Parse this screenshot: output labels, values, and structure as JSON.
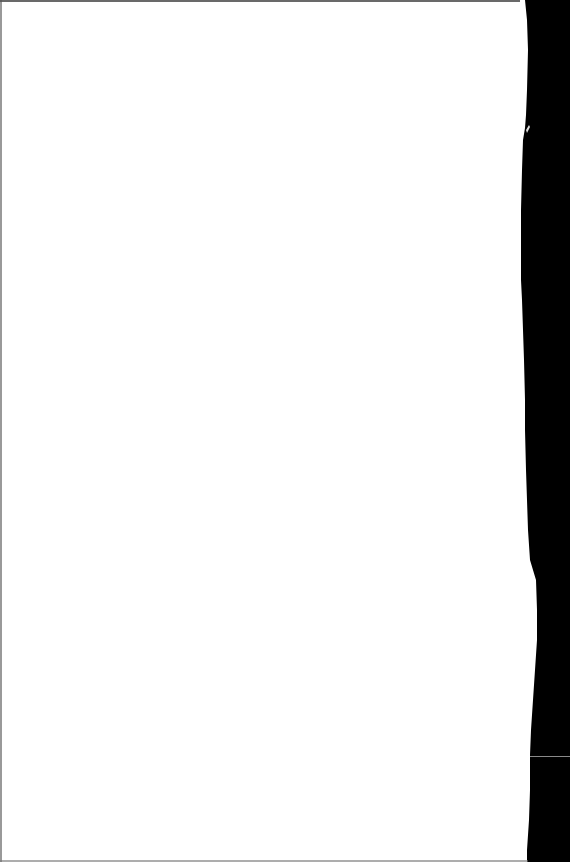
{
  "document": {
    "description": "Blank scanned page",
    "text": "",
    "colors": {
      "page": "#ffffff",
      "background": "#000000",
      "edge_line": "#8a8a8a",
      "top_shadow": "#2a2a2a"
    }
  }
}
